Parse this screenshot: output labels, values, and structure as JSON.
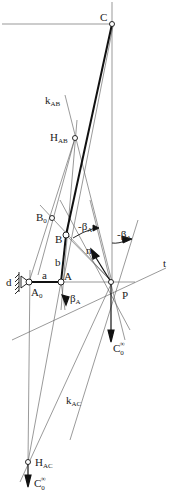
{
  "diagram": {
    "type": "mechanism-kinematics",
    "labels": {
      "C": "C",
      "k_AB": "k",
      "k_AB_sub": "AB",
      "H_AB": "H",
      "H_AB_sub": "AB",
      "B0": "B",
      "B0_sub": "0",
      "B": "B",
      "neg_beta_A_1": "-β",
      "neg_beta_A_1_sub": "A",
      "neg_beta_A_2": "-β",
      "neg_beta_A_2_sub": "A",
      "n": "n",
      "b": "b",
      "t": "t",
      "d": "d",
      "a": "a",
      "A": "A",
      "A0": "A",
      "A0_sub": "0",
      "beta_A": "β",
      "beta_A_sub": "A",
      "P": "P",
      "C0_inf_1": "C",
      "C0_inf_1_sub": "0",
      "C0_inf_1_sup": "∞",
      "k_AC": "k",
      "k_AC_sub": "AC",
      "H_AC": "H",
      "H_AC_sub": "AC",
      "C0_inf_2": "C",
      "C0_inf_2_sub": "0",
      "C0_inf_2_sup": "∞"
    },
    "points": {
      "C": [
        112,
        24
      ],
      "H_AB": [
        75,
        138
      ],
      "B0": [
        52,
        218
      ],
      "B": [
        66,
        235
      ],
      "A0": [
        29,
        282
      ],
      "A": [
        61,
        282
      ],
      "P": [
        111,
        282
      ],
      "H_AC": [
        28,
        462
      ]
    },
    "colors": {
      "line": "#333333",
      "thin": "#666666",
      "background": "#ffffff"
    }
  }
}
